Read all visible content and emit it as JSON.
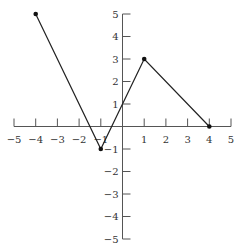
{
  "chart_data": {
    "type": "line",
    "title": "",
    "xlabel": "",
    "ylabel": "",
    "xlim": [
      -5,
      5
    ],
    "ylim": [
      -5,
      5
    ],
    "grid": false,
    "x_ticks": [
      -5,
      -4,
      -3,
      -2,
      -1,
      1,
      2,
      3,
      4,
      5
    ],
    "y_ticks": [
      -5,
      -4,
      -3,
      -2,
      -1,
      1,
      2,
      3,
      4,
      5
    ],
    "series": [
      {
        "name": "piecewise",
        "points": [
          [
            -4,
            5
          ],
          [
            -1,
            -1
          ],
          [
            1,
            3
          ],
          [
            4,
            0
          ]
        ],
        "markers": true
      }
    ]
  },
  "colors": {
    "axis": "#555555",
    "line": "#222222",
    "point": "#111111"
  }
}
